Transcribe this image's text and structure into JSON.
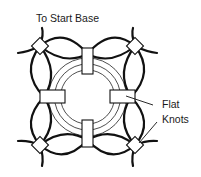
{
  "diagram": {
    "labels": {
      "top": "To Start Base",
      "right_line1": "Flat",
      "right_line2": "Knots"
    },
    "components": {
      "center_ring": "concentric-ring",
      "inner_knots": [
        "top",
        "left",
        "right",
        "bottom"
      ],
      "corner_knots": [
        "top-left",
        "top-right",
        "bottom-left",
        "bottom-right"
      ]
    },
    "colors": {
      "stroke": "#111111",
      "background": "#ffffff"
    }
  }
}
